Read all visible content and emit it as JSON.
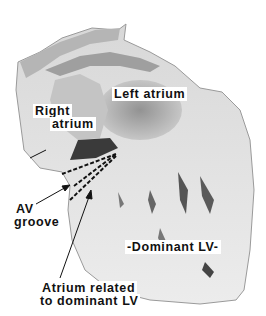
{
  "figure": {
    "labels": {
      "left_atrium": "Left atrium",
      "right_atrium_line1": "Right",
      "right_atrium_line2": "atrium",
      "av_groove_line1": "AV",
      "av_groove_line2": "groove",
      "dominant_lv": "-Dominant LV-",
      "atrium_related_line1": "Atrium related",
      "atrium_related_line2": "to dominant LV"
    }
  }
}
